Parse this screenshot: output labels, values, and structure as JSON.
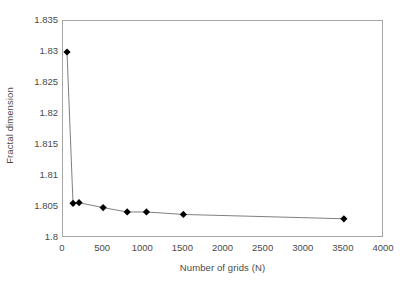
{
  "chart_data": {
    "type": "line",
    "title": "",
    "subtitle": "",
    "xlabel": "Number of grids (N)",
    "ylabel": "Fractal dimension",
    "xlim": [
      0,
      4000
    ],
    "ylim": [
      1.8,
      1.835
    ],
    "xticks": [
      "0",
      "500",
      "1000",
      "1500",
      "2000",
      "2500",
      "3000",
      "3500",
      "4000"
    ],
    "xtick_values": [
      0,
      500,
      1000,
      1500,
      2000,
      2500,
      3000,
      3500,
      4000
    ],
    "yticks": [
      "1.8",
      "1.805",
      "1.81",
      "1.815",
      "1.82",
      "1.825",
      "1.83",
      "1.835"
    ],
    "ytick_values": [
      1.8,
      1.805,
      1.81,
      1.815,
      1.82,
      1.825,
      1.83,
      1.835
    ],
    "grid": false,
    "legend": null,
    "legend_position": "none",
    "marker": "diamond",
    "marker_color": "#000000",
    "line_color": "#808080",
    "frame_color": "#a6a6a6",
    "background": "#ffffff",
    "series": [
      {
        "name": "Fractal dimension vs number of grids",
        "x": [
          50,
          125,
          500,
          800,
          1040,
          1500,
          3500
        ],
        "values": [
          1.83,
          1.8056,
          1.8057,
          1.8049,
          1.8042,
          1.8042,
          1.8037
        ],
        "points": [
          {
            "x": 50,
            "y": 1.83
          },
          {
            "x": 125,
            "y": 1.8056
          },
          {
            "x": 200,
            "y": 1.8057
          },
          {
            "x": 500,
            "y": 1.8049
          },
          {
            "x": 800,
            "y": 1.8042
          },
          {
            "x": 1040,
            "y": 1.8042
          },
          {
            "x": 1500,
            "y": 1.8038
          },
          {
            "x": 3500,
            "y": 1.8031
          }
        ]
      }
    ]
  },
  "axes": {
    "x_title": "Number of grids (N)",
    "y_title": "Fractal dimension"
  }
}
